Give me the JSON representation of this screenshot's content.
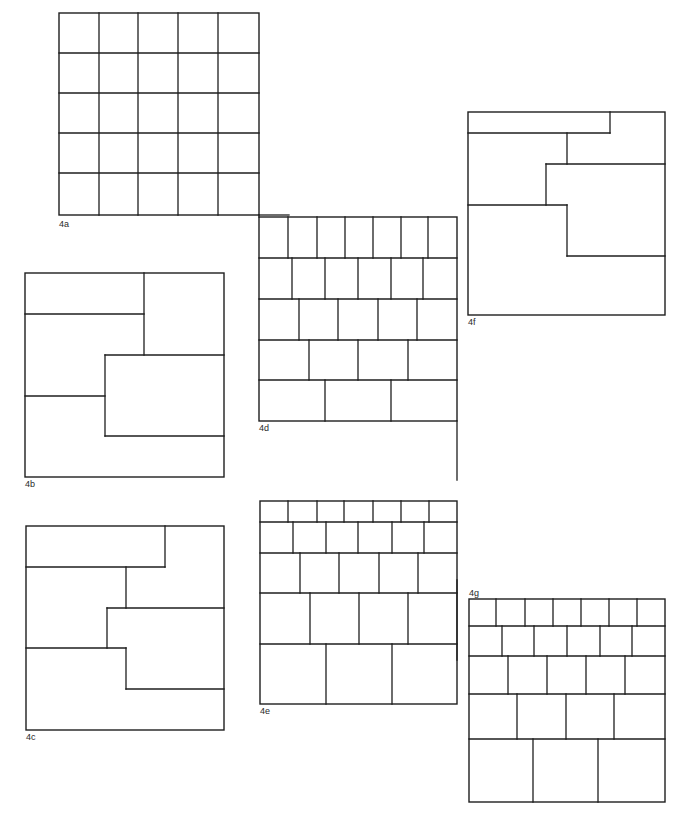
{
  "page": {
    "width": 687,
    "height": 825,
    "background": "#ffffff",
    "stroke": "#1e1e1e"
  },
  "figures": [
    {
      "id": "4a",
      "label": "4a",
      "label_pos": [
        59,
        220
      ],
      "frame": [
        59,
        13,
        259,
        215
      ],
      "lines": [
        [
          99,
          13,
          99,
          215
        ],
        [
          138,
          13,
          138,
          215
        ],
        [
          178,
          13,
          178,
          215
        ],
        [
          218,
          13,
          218,
          215
        ],
        [
          59,
          53,
          259,
          53
        ],
        [
          59,
          93,
          259,
          93
        ],
        [
          59,
          133,
          259,
          133
        ],
        [
          59,
          173,
          259,
          173
        ]
      ]
    },
    {
      "id": "4d",
      "label": "4d",
      "label_pos": [
        259,
        424
      ],
      "frame": [
        259,
        217,
        457,
        421
      ],
      "lines": [
        [
          259,
          258,
          457,
          258
        ],
        [
          259,
          299,
          457,
          299
        ],
        [
          259,
          340,
          457,
          340
        ],
        [
          259,
          380,
          457,
          380
        ],
        [
          288,
          217,
          288,
          258
        ],
        [
          317,
          217,
          317,
          258
        ],
        [
          345,
          217,
          345,
          258
        ],
        [
          373,
          217,
          373,
          258
        ],
        [
          401,
          217,
          401,
          258
        ],
        [
          428,
          217,
          428,
          258
        ],
        [
          292,
          258,
          292,
          299
        ],
        [
          325,
          258,
          325,
          299
        ],
        [
          358,
          258,
          358,
          299
        ],
        [
          391,
          258,
          391,
          299
        ],
        [
          423,
          258,
          423,
          299
        ],
        [
          299,
          299,
          299,
          340
        ],
        [
          338,
          299,
          338,
          340
        ],
        [
          378,
          299,
          378,
          340
        ],
        [
          417,
          299,
          417,
          340
        ],
        [
          309,
          340,
          309,
          380
        ],
        [
          358,
          340,
          358,
          380
        ],
        [
          408,
          340,
          408,
          380
        ],
        [
          325,
          380,
          325,
          421
        ],
        [
          391,
          380,
          391,
          421
        ]
      ]
    },
    {
      "id": "4f",
      "label": "4f",
      "label_pos": [
        468,
        318
      ],
      "frame": [
        468,
        112,
        665,
        315
      ],
      "lines": [
        [
          468,
          133,
          610,
          133
        ],
        [
          610,
          112,
          610,
          133
        ],
        [
          567,
          133,
          567,
          164
        ],
        [
          546,
          164,
          665,
          164
        ],
        [
          546,
          164,
          546,
          205
        ],
        [
          468,
          205,
          567,
          205
        ],
        [
          567,
          205,
          567,
          256
        ],
        [
          567,
          256,
          665,
          256
        ]
      ]
    },
    {
      "id": "4b",
      "label": "4b",
      "label_pos": [
        25,
        480
      ],
      "frame": [
        25,
        273,
        224,
        477
      ],
      "lines": [
        [
          144,
          273,
          144,
          355
        ],
        [
          25,
          314,
          144,
          314
        ],
        [
          105,
          355,
          224,
          355
        ],
        [
          105,
          355,
          105,
          436
        ],
        [
          25,
          396,
          105,
          396
        ],
        [
          105,
          436,
          224,
          436
        ]
      ]
    },
    {
      "id": "4c",
      "label": "4c",
      "label_pos": [
        26,
        733
      ],
      "frame": [
        26,
        526,
        224,
        730
      ],
      "lines": [
        [
          165,
          526,
          165,
          567
        ],
        [
          26,
          567,
          165,
          567
        ],
        [
          126,
          567,
          126,
          608
        ],
        [
          107,
          608,
          224,
          608
        ],
        [
          107,
          608,
          107,
          648
        ],
        [
          26,
          648,
          126,
          648
        ],
        [
          126,
          648,
          126,
          689
        ],
        [
          126,
          689,
          224,
          689
        ]
      ]
    },
    {
      "id": "4e",
      "label": "4e",
      "label_pos": [
        260,
        707
      ],
      "frame": [
        260,
        501,
        457,
        704
      ],
      "lines": [
        [
          260,
          522,
          457,
          522
        ],
        [
          260,
          553,
          457,
          553
        ],
        [
          260,
          593,
          457,
          593
        ],
        [
          260,
          644,
          457,
          644
        ],
        [
          288,
          501,
          288,
          522
        ],
        [
          317,
          501,
          317,
          522
        ],
        [
          344,
          501,
          344,
          522
        ],
        [
          373,
          501,
          373,
          522
        ],
        [
          401,
          501,
          401,
          522
        ],
        [
          429,
          501,
          429,
          522
        ],
        [
          293,
          522,
          293,
          553
        ],
        [
          326,
          522,
          326,
          553
        ],
        [
          358,
          522,
          358,
          553
        ],
        [
          392,
          522,
          392,
          553
        ],
        [
          424,
          522,
          424,
          553
        ],
        [
          300,
          553,
          300,
          593
        ],
        [
          339,
          553,
          339,
          593
        ],
        [
          379,
          553,
          379,
          593
        ],
        [
          418,
          553,
          418,
          593
        ],
        [
          310,
          593,
          310,
          644
        ],
        [
          359,
          593,
          359,
          644
        ],
        [
          408,
          593,
          408,
          644
        ],
        [
          326,
          644,
          326,
          704
        ],
        [
          392,
          644,
          392,
          704
        ]
      ]
    },
    {
      "id": "4g",
      "label": "4g",
      "label_pos": [
        469,
        589
      ],
      "frame": [
        469,
        599,
        665,
        802
      ],
      "lines": [
        [
          469,
          626,
          665,
          626
        ],
        [
          469,
          656,
          665,
          656
        ],
        [
          469,
          694,
          665,
          694
        ],
        [
          469,
          739,
          665,
          739
        ],
        [
          496,
          599,
          496,
          626
        ],
        [
          525,
          599,
          525,
          626
        ],
        [
          553,
          599,
          553,
          626
        ],
        [
          581,
          599,
          581,
          626
        ],
        [
          609,
          599,
          609,
          626
        ],
        [
          637,
          599,
          637,
          626
        ],
        [
          502,
          626,
          502,
          656
        ],
        [
          534,
          626,
          534,
          656
        ],
        [
          567,
          626,
          567,
          656
        ],
        [
          600,
          626,
          600,
          656
        ],
        [
          632,
          626,
          632,
          656
        ],
        [
          508,
          656,
          508,
          694
        ],
        [
          547,
          656,
          547,
          694
        ],
        [
          586,
          656,
          586,
          694
        ],
        [
          625,
          656,
          625,
          694
        ],
        [
          517,
          694,
          517,
          739
        ],
        [
          566,
          694,
          566,
          739
        ],
        [
          614,
          694,
          614,
          739
        ],
        [
          533,
          739,
          533,
          802
        ],
        [
          598,
          739,
          598,
          802
        ]
      ]
    }
  ],
  "connectors": [
    [
      259,
      215,
      259,
      217
    ],
    [
      259,
      215,
      289,
      215
    ],
    [
      457,
      421,
      457,
      480
    ],
    [
      457,
      580,
      457,
      660
    ]
  ]
}
